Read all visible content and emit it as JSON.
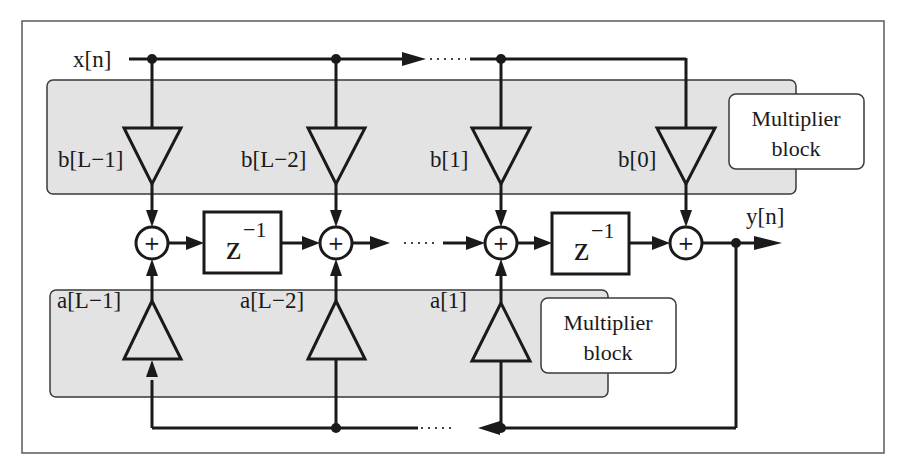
{
  "diagram": {
    "type": "IIR filter direct-form block diagram",
    "input_label": "x[n]",
    "output_label": "y[n]",
    "delay_label": "z",
    "delay_exponent": "−1",
    "adder_symbol": "+",
    "feedforward_block": {
      "callout_line1": "Multiplier",
      "callout_line2": "block",
      "coefficients": [
        "b[L−1]",
        "b[L−2]",
        "b[1]",
        "b[0]"
      ]
    },
    "feedback_block": {
      "callout_line1": "Multiplier",
      "callout_line2": "block",
      "coefficients": [
        "a[L−1]",
        "a[L−2]",
        "a[1]"
      ]
    },
    "colors": {
      "block_fill": "#e3e3e3",
      "line": "#1a1a1a",
      "background": "#ffffff"
    }
  }
}
